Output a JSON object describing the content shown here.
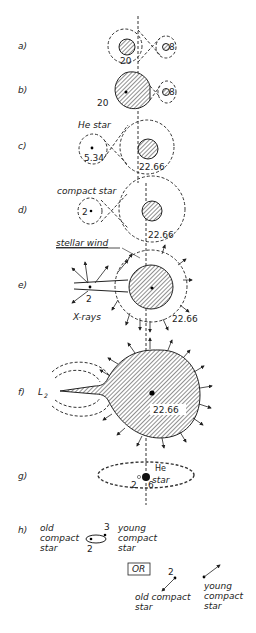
{
  "diagram": {
    "axis_style": "dashed vertical line (center of mass)",
    "stages": [
      {
        "label": "a)",
        "primary_mass": "20",
        "secondary_mass": "8"
      },
      {
        "label": "b)",
        "primary_mass": "20",
        "secondary_mass": "8"
      },
      {
        "label": "c)",
        "annotation": "He star",
        "primary_mass": "5.34",
        "secondary_mass": "22.66"
      },
      {
        "label": "d)",
        "annotation": "compact star",
        "primary_mass": "2",
        "secondary_mass": "22.66"
      },
      {
        "label": "e)",
        "annotation_top": "stellar wind",
        "annotation_bottom": "X-rays",
        "compact_mass": "2",
        "secondary_mass": "22.66"
      },
      {
        "label": "f)",
        "lagrange_point": "L2",
        "secondary_mass": "22.66"
      },
      {
        "label": "g)",
        "annotation": "He star",
        "compact_mass": "2",
        "he_mass": "6"
      },
      {
        "label": "h)",
        "old": "old compact star",
        "young": "young compact star",
        "old_mass": "2",
        "young_mass": "3",
        "or_box": "OR",
        "alt_old": "old compact star",
        "alt_young": "young compact star",
        "alt_mass": "2"
      }
    ]
  },
  "text": {
    "a": "a)",
    "b": "b)",
    "c": "c)",
    "d": "d)",
    "e": "e)",
    "f": "f)",
    "g": "g)",
    "h": "h)",
    "m20": "20",
    "m8": "8",
    "he_star": "He star",
    "m534": "5.34",
    "m2266": "22.66",
    "compact_star": "compact star",
    "m2": "2",
    "stellar_wind": "stellar wind",
    "xrays": "X-rays",
    "L2": "L",
    "L2sub": "2",
    "he": "He",
    "star": "star",
    "m6": "6",
    "old": "old",
    "compact": "compact",
    "young": "young",
    "m3": "3",
    "or": "OR",
    "old_compact": "old compact"
  }
}
